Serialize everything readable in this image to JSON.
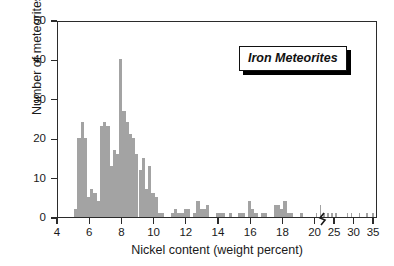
{
  "chart_data": {
    "type": "bar",
    "title": "Iron Meteorites",
    "xlabel": "Nickel content (weight percent)",
    "ylabel": "Number of meteorites",
    "grid": false,
    "legend_position": "top-right",
    "annotations": [
      "axis break between 20 and 25 on x-axis"
    ],
    "xlim": [
      4,
      36
    ],
    "ylim": [
      0,
      50
    ],
    "xticks": [
      4,
      6,
      8,
      10,
      12,
      14,
      16,
      18,
      20,
      25,
      30,
      35
    ],
    "xtick_labels": [
      "4",
      "6",
      "8",
      "10",
      "12",
      "14",
      "16",
      "18",
      "20",
      "25",
      "30",
      "35"
    ],
    "yticks": [
      0,
      10,
      20,
      30,
      40,
      50
    ],
    "ytick_labels": [
      "0",
      "10",
      "20",
      "30",
      "40",
      "50"
    ],
    "bin_width": 0.2,
    "x": [
      5.0,
      5.2,
      5.4,
      5.6,
      5.8,
      6.0,
      6.2,
      6.4,
      6.6,
      6.8,
      7.0,
      7.2,
      7.4,
      7.6,
      7.8,
      8.0,
      8.2,
      8.4,
      8.6,
      8.8,
      9.0,
      9.2,
      9.4,
      9.6,
      9.8,
      10.0,
      10.2,
      10.4,
      10.6,
      10.8,
      11.0,
      11.2,
      11.4,
      11.6,
      11.8,
      12.0,
      12.2,
      12.4,
      12.6,
      12.8,
      13.0,
      13.2,
      13.4,
      13.6,
      13.8,
      14.0,
      14.2,
      14.4,
      14.6,
      14.8,
      15.0,
      15.2,
      15.4,
      15.6,
      15.8,
      16.0,
      16.2,
      16.4,
      16.6,
      16.8,
      17.0,
      17.2,
      17.4,
      17.6,
      17.8,
      18.0,
      18.2,
      18.4,
      18.6,
      18.8,
      19.0,
      19.4,
      20.0,
      21.0,
      22.0,
      23.0,
      24.0,
      25.0,
      26.0,
      28.0,
      29.0,
      30.0,
      31.0,
      33.0,
      34.5
    ],
    "values": [
      2,
      20,
      24,
      20,
      5,
      7,
      6,
      4,
      23,
      24,
      23,
      13,
      17,
      16,
      40,
      27,
      24,
      21,
      20,
      16,
      12,
      15,
      7,
      13,
      6,
      5,
      1,
      1,
      0,
      0,
      1,
      2,
      1,
      1,
      2,
      2,
      0,
      1,
      4,
      2,
      2,
      3,
      0,
      0,
      1,
      1,
      1,
      0,
      1,
      0,
      0,
      1,
      1,
      0,
      4,
      2,
      1,
      0,
      1,
      1,
      0,
      0,
      3,
      3,
      2,
      4,
      1,
      1,
      0,
      0,
      1,
      0,
      1,
      3,
      1,
      1,
      1,
      1,
      0,
      1,
      1,
      0,
      1,
      1,
      1
    ],
    "series": [
      {
        "name": "Iron Meteorites",
        "color": "#a3a3a3"
      }
    ]
  },
  "axes": {
    "xlabel": "Nickel content (weight percent)",
    "ylabel": "Number of meteorites"
  },
  "legend": {
    "label": "Iron Meteorites"
  }
}
